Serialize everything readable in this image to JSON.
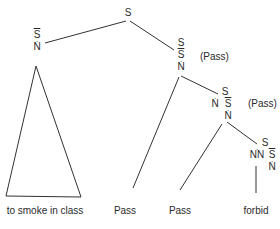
{
  "diagram": {
    "type": "syntax-tree",
    "root": {
      "label": "S"
    },
    "nodes": {
      "left_np": {
        "line1": "S",
        "line2": "N"
      },
      "mid": {
        "line1": "S",
        "line2": "S",
        "line3": "N",
        "note": "(Pass)"
      },
      "lower": {
        "line1": "S",
        "line2a": "N",
        "line2b": "S",
        "line3": "N",
        "note": "(Pass)"
      },
      "bottom": {
        "line1": "S",
        "line2a": "NN",
        "line2b": "S",
        "line3": "N"
      }
    },
    "leaves": [
      {
        "label": "to smoke in class"
      },
      {
        "label": "Pass"
      },
      {
        "label": "Pass"
      },
      {
        "label": "forbid"
      }
    ],
    "colors": {
      "line": "#333333",
      "text": "#2a2a2a",
      "background": "#ffffff"
    }
  }
}
